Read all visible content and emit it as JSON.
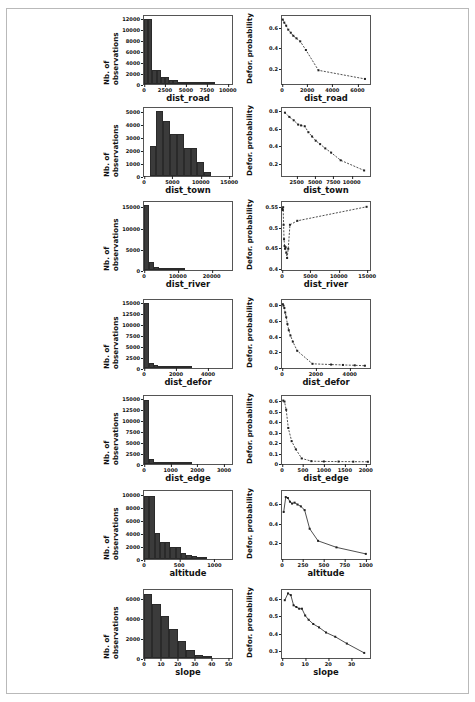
{
  "figure": {
    "background_color": "#ffffff",
    "border_color": "#b9b9b9",
    "bar_color": "#3b3b3b",
    "line_color": "#222222",
    "n_rows": 7,
    "n_cols": 2,
    "left_column_ylabel": "Nb. of observations",
    "right_column_ylabel": "Defor. probability"
  },
  "chart_data": [
    {
      "type": "bar",
      "title": "",
      "xlabel": "dist_road",
      "ylabel": "Nb. of observations",
      "xlim": [
        0,
        10500
      ],
      "ylim": [
        0,
        12800
      ],
      "xticks": [
        0,
        2500,
        5000,
        7500,
        10000
      ],
      "yticks": [
        0,
        2000,
        4000,
        6000,
        8000,
        10000,
        12000
      ],
      "categories": [
        250,
        750,
        1250,
        1750,
        2250,
        2750,
        3250,
        3750,
        4250,
        4750,
        5250,
        5750,
        6250,
        6750,
        7250,
        7750,
        8250
      ],
      "bin_edges": [
        0,
        500,
        1000,
        1500,
        2000,
        2500,
        3000,
        3500,
        4000,
        4500,
        5000,
        5500,
        6000,
        6500,
        7000,
        7500,
        8000,
        8500
      ],
      "values": [
        12300,
        12300,
        2700,
        2700,
        1300,
        1300,
        750,
        750,
        420,
        420,
        260,
        170,
        120,
        90,
        60,
        40,
        25
      ],
      "grid": false
    },
    {
      "type": "line",
      "title": "",
      "xlabel": "dist_road",
      "ylabel": "Defor. probability",
      "xlim": [
        0,
        7000
      ],
      "ylim": [
        0.05,
        0.72
      ],
      "xticks": [
        0,
        2000,
        4000,
        6000
      ],
      "yticks": [
        0.2,
        0.4,
        0.6
      ],
      "x": [
        60,
        180,
        330,
        500,
        700,
        900,
        1150,
        1450,
        1900,
        2900,
        6600
      ],
      "y": [
        0.685,
        0.655,
        0.625,
        0.585,
        0.555,
        0.525,
        0.5,
        0.47,
        0.385,
        0.185,
        0.1
      ],
      "marker": "square",
      "linestyle": "dashed",
      "grid": false
    },
    {
      "type": "bar",
      "title": "",
      "xlabel": "dist_town",
      "ylabel": "Nb. of observations",
      "xlim": [
        0,
        15500
      ],
      "ylim": [
        0,
        5400
      ],
      "xticks": [
        0,
        5000,
        10000,
        15000
      ],
      "yticks": [
        0,
        1000,
        2000,
        3000,
        4000,
        5000
      ],
      "bin_edges": [
        1000,
        2200,
        3400,
        4600,
        5800,
        7000,
        8200,
        9400,
        10600,
        11800
      ],
      "categories": [
        1600,
        2800,
        4000,
        5200,
        6400,
        7600,
        8800,
        10000,
        11200
      ],
      "values": [
        2350,
        5200,
        4350,
        3300,
        3300,
        2200,
        2200,
        1150,
        350
      ],
      "grid": false
    },
    {
      "type": "line",
      "title": "",
      "xlabel": "dist_town",
      "ylabel": "Defor. probability",
      "xlim": [
        500,
        12500
      ],
      "ylim": [
        0.05,
        0.85
      ],
      "xticks": [
        2500,
        5000,
        7500,
        10000
      ],
      "yticks": [
        0.2,
        0.4,
        0.6,
        0.8
      ],
      "x": [
        900,
        1500,
        2100,
        2700,
        3100,
        3600,
        4100,
        4600,
        5100,
        5700,
        6400,
        7200,
        8500,
        11700
      ],
      "y": [
        0.795,
        0.745,
        0.705,
        0.655,
        0.645,
        0.635,
        0.565,
        0.515,
        0.465,
        0.425,
        0.375,
        0.325,
        0.235,
        0.115
      ],
      "marker": "square",
      "linestyle": "dashed",
      "grid": false
    },
    {
      "type": "bar",
      "title": "",
      "xlabel": "dist_river",
      "ylabel": "Nb. of observations",
      "xlim": [
        0,
        26000
      ],
      "ylim": [
        0,
        16500
      ],
      "xticks": [
        0,
        10000,
        20000
      ],
      "yticks": [
        0,
        5000,
        10000,
        15000
      ],
      "bin_edges": [
        0,
        1500,
        3000,
        4500,
        6000,
        7500,
        9000,
        10500,
        12000
      ],
      "categories": [
        750,
        2250,
        3750,
        5250,
        6750,
        8250,
        9750,
        11250
      ],
      "values": [
        15800,
        2000,
        800,
        350,
        180,
        100,
        60,
        30
      ],
      "grid": false
    },
    {
      "type": "line",
      "title": "",
      "xlabel": "dist_river",
      "ylabel": "Defor. probability",
      "xlim": [
        0,
        15500
      ],
      "ylim": [
        0.395,
        0.565
      ],
      "xticks": [
        0,
        5000,
        10000,
        15000
      ],
      "yticks": [
        0.4,
        0.45,
        0.5,
        0.55
      ],
      "x": [
        60,
        130,
        200,
        280,
        360,
        450,
        540,
        640,
        760,
        900,
        1100,
        1400,
        2700,
        14900
      ],
      "y": [
        0.548,
        0.545,
        0.552,
        0.508,
        0.472,
        0.455,
        0.448,
        0.452,
        0.438,
        0.425,
        0.448,
        0.508,
        0.518,
        0.553
      ],
      "marker": "square",
      "linestyle": "dashed",
      "grid": false
    },
    {
      "type": "bar",
      "title": "",
      "xlabel": "dist_defor",
      "ylabel": "Nb. of observations",
      "xlim": [
        0,
        5500
      ],
      "ylim": [
        0,
        16000
      ],
      "xticks": [
        0,
        2000,
        4000
      ],
      "yticks": [
        0,
        2500,
        5000,
        7500,
        10000,
        12500,
        15000
      ],
      "bin_edges": [
        0,
        300,
        600,
        900,
        1200,
        1500,
        1800,
        2100,
        2400,
        2700,
        3000
      ],
      "categories": [
        150,
        450,
        750,
        1050,
        1350,
        1650,
        1950,
        2250,
        2550,
        2850
      ],
      "values": [
        15200,
        1200,
        600,
        380,
        250,
        170,
        120,
        80,
        55,
        35
      ],
      "grid": false
    },
    {
      "type": "line",
      "title": "",
      "xlabel": "dist_defor",
      "ylabel": "Defor. probability",
      "xlim": [
        0,
        5200
      ],
      "ylim": [
        -0.01,
        0.88
      ],
      "xticks": [
        0,
        2000,
        4000
      ],
      "yticks": [
        0.0,
        0.2,
        0.4,
        0.6,
        0.8
      ],
      "x": [
        50,
        90,
        140,
        190,
        250,
        320,
        400,
        500,
        640,
        900,
        1800,
        2900,
        3600,
        4300,
        4900
      ],
      "y": [
        0.825,
        0.805,
        0.775,
        0.715,
        0.655,
        0.565,
        0.485,
        0.415,
        0.335,
        0.215,
        0.045,
        0.035,
        0.03,
        0.025,
        0.02
      ],
      "marker": "square",
      "linestyle": "dashed",
      "grid": false
    },
    {
      "type": "bar",
      "title": "",
      "xlabel": "dist_edge",
      "ylabel": "Nb. of observations",
      "xlim": [
        0,
        3300
      ],
      "ylim": [
        0,
        16000
      ],
      "xticks": [
        0,
        1000,
        2000,
        3000
      ],
      "yticks": [
        0,
        2500,
        5000,
        7500,
        10000,
        12500,
        15000
      ],
      "bin_edges": [
        0,
        180,
        360,
        540,
        720,
        900,
        1080,
        1260,
        1440,
        1620,
        1800
      ],
      "categories": [
        90,
        270,
        450,
        630,
        810,
        990,
        1170,
        1350,
        1530,
        1710
      ],
      "values": [
        15100,
        1100,
        550,
        320,
        210,
        140,
        95,
        65,
        45,
        30
      ],
      "grid": false
    },
    {
      "type": "line",
      "title": "",
      "xlabel": "dist_edge",
      "ylabel": "Defor. probability",
      "xlim": [
        0,
        2100
      ],
      "ylim": [
        -0.01,
        0.66
      ],
      "xticks": [
        0,
        500,
        1000,
        1500,
        2000
      ],
      "yticks": [
        0.0,
        0.1,
        0.2,
        0.3,
        0.4,
        0.5,
        0.6
      ],
      "x": [
        30,
        60,
        100,
        150,
        230,
        330,
        470,
        700,
        1000,
        1350,
        1700,
        2050
      ],
      "y": [
        0.615,
        0.605,
        0.525,
        0.345,
        0.215,
        0.135,
        0.045,
        0.018,
        0.015,
        0.014,
        0.013,
        0.012
      ],
      "marker": "square",
      "linestyle": "dashed",
      "grid": false
    },
    {
      "type": "bar",
      "title": "",
      "xlabel": "altitude",
      "ylabel": "Nb. of observations",
      "xlim": [
        0,
        1250
      ],
      "ylim": [
        0,
        10700
      ],
      "xticks": [
        0,
        500,
        1000
      ],
      "yticks": [
        0,
        2000,
        4000,
        6000,
        8000,
        10000
      ],
      "bin_edges": [
        0,
        75,
        150,
        225,
        300,
        375,
        450,
        525,
        600,
        675,
        750,
        825,
        900
      ],
      "categories": [
        37,
        112,
        187,
        262,
        337,
        412,
        487,
        562,
        637,
        712,
        787,
        862
      ],
      "values": [
        9900,
        9900,
        4150,
        2700,
        2700,
        1900,
        1900,
        1000,
        600,
        400,
        250,
        150
      ],
      "grid": false
    },
    {
      "type": "line",
      "title": "",
      "xlabel": "altitude",
      "ylabel": "Defor. probability",
      "xlim": [
        0,
        1050
      ],
      "ylim": [
        0.02,
        0.75
      ],
      "xticks": [
        0,
        250,
        500,
        750,
        1000
      ],
      "yticks": [
        0.2,
        0.4,
        0.6
      ],
      "x": [
        20,
        45,
        70,
        95,
        120,
        150,
        185,
        225,
        270,
        330,
        430,
        650,
        1000
      ],
      "y": [
        0.525,
        0.685,
        0.675,
        0.635,
        0.615,
        0.625,
        0.605,
        0.585,
        0.545,
        0.345,
        0.215,
        0.145,
        0.075
      ],
      "marker": "square",
      "linestyle": "solid",
      "grid": false
    },
    {
      "type": "bar",
      "title": "",
      "xlabel": "slope",
      "ylabel": "Nb. of observations",
      "xlim": [
        0,
        52
      ],
      "ylim": [
        0,
        7000
      ],
      "xticks": [
        0,
        10,
        20,
        30,
        40,
        50
      ],
      "yticks": [
        0,
        2000,
        4000,
        6000
      ],
      "bin_edges": [
        0,
        5,
        10,
        15,
        20,
        25,
        30,
        35,
        40
      ],
      "categories": [
        2.5,
        7.5,
        12.5,
        17.5,
        22.5,
        27.5,
        32.5,
        37.5
      ],
      "values": [
        6550,
        5600,
        4350,
        3000,
        1750,
        800,
        300,
        100
      ],
      "grid": false
    },
    {
      "type": "line",
      "title": "",
      "xlabel": "slope",
      "ylabel": "Defor. probability",
      "xlim": [
        0,
        38
      ],
      "ylim": [
        0.255,
        0.655
      ],
      "xticks": [
        0,
        10,
        20,
        30
      ],
      "yticks": [
        0.3,
        0.4,
        0.5,
        0.6
      ],
      "x": [
        1.2,
        2.6,
        3.8,
        5.0,
        6.2,
        7.4,
        8.6,
        10.0,
        11.5,
        13.5,
        16.0,
        19.0,
        23.0,
        28.0,
        35.5
      ],
      "y": [
        0.595,
        0.635,
        0.625,
        0.565,
        0.555,
        0.545,
        0.545,
        0.505,
        0.48,
        0.455,
        0.435,
        0.405,
        0.38,
        0.34,
        0.285
      ],
      "marker": "square",
      "linestyle": "solid",
      "grid": false
    }
  ]
}
